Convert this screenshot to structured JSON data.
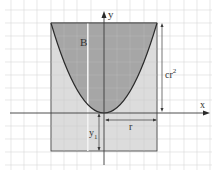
{
  "diagram": {
    "labels": {
      "region": "B",
      "y_axis": "y",
      "x_axis": "x",
      "height_dim": "cr",
      "height_dim_sup": "2",
      "radius_dim": "r",
      "y1_base": "y",
      "y1_sub": "1"
    },
    "colors": {
      "background": "#ffffff",
      "grid": "#d8d8d8",
      "rect_fill": "#dcdcdc",
      "region_fill": "#a6a6a6",
      "axis": "#3a3a3a",
      "curve": "#2a2a2a",
      "stripe": "#f2f2f2"
    }
  }
}
